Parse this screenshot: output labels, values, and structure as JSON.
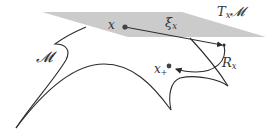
{
  "diagram": {
    "type": "manifold-retraction",
    "labels": {
      "manifold": "𝓜",
      "tangent_space": "T",
      "tangent_space_sub": "x",
      "tangent_space_suffix": "𝓜",
      "point_x": "x",
      "tangent_vector": "ξ",
      "tangent_vector_sub": "x",
      "retraction": "R",
      "retraction_sub": "x",
      "point_x_plus": "x",
      "point_x_plus_sub": "+"
    },
    "colors": {
      "plane_fill": "#c8c8c8",
      "curve_stroke": "#2a2a2a",
      "point_fill": "#444444",
      "text": "#333333",
      "background": "#ffffff"
    }
  }
}
